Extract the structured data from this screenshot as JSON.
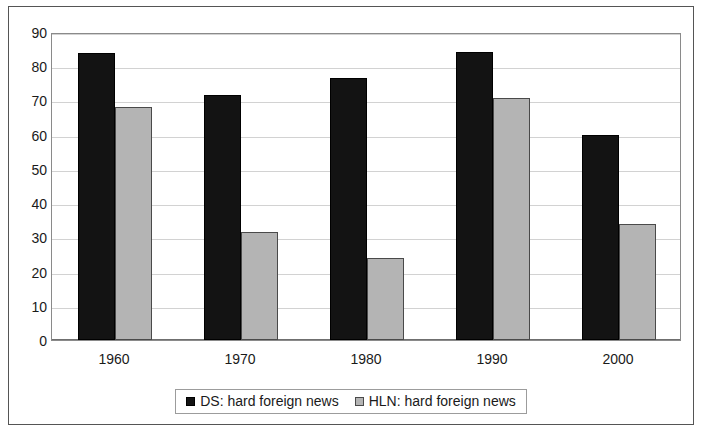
{
  "chart_data": {
    "type": "bar",
    "title": "",
    "subtitle": "",
    "xlabel": "",
    "ylabel": "",
    "categories": [
      "1960",
      "1970",
      "1980",
      "1990",
      "2000"
    ],
    "series": [
      {
        "name": "DS: hard foreign news",
        "color": "#131313",
        "values": [
          84,
          71.5,
          76.5,
          84.3,
          59.8
        ]
      },
      {
        "name": "HLN: hard foreign news",
        "color": "#b4b4b4",
        "values": [
          68,
          31.5,
          24,
          70.8,
          34
        ]
      }
    ],
    "ylim": [
      0,
      90
    ],
    "ytick_step": 10,
    "yticks": [
      "0",
      "10",
      "20",
      "30",
      "40",
      "50",
      "60",
      "70",
      "80",
      "90"
    ],
    "grid": true,
    "legend_position": "bottom"
  },
  "legend": {
    "entries": [
      {
        "label": "DS: hard foreign news"
      },
      {
        "label": "HLN: hard foreign news"
      }
    ]
  }
}
